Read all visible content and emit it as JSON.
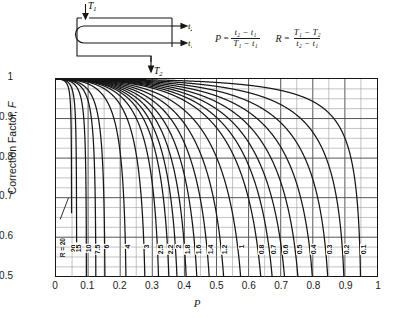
{
  "diagram": {
    "name": "one-shell-two-tube-pass-heat-exchanger",
    "inlet_shell_label": "T₁",
    "outlet_shell_label": "T₂",
    "outlet_tube_label": "t₂",
    "inlet_tube_label": "t₁"
  },
  "formulas": {
    "p": {
      "lhs": "P",
      "numerator": "t₂ − t₁",
      "denominator": "T₁ − t₁"
    },
    "r": {
      "lhs": "R",
      "numerator": "T₁ − T₂",
      "denominator": "t₂ − t₁"
    }
  },
  "chart_data": {
    "type": "line",
    "title": "",
    "xlabel": "P",
    "ylabel": "Correction Factor, F",
    "xlim": [
      0,
      1
    ],
    "ylim": [
      0.5,
      1
    ],
    "xticks": [
      "0",
      "0.1",
      "0.2",
      "0.3",
      "0.4",
      "0.5",
      "0.6",
      "0.7",
      "0.8",
      "0.9",
      "1"
    ],
    "yticks": [
      "0.5",
      "0.6",
      "0.7",
      "0.8",
      "0.9",
      "1"
    ],
    "grid": "major 0.1 x / 0.1 y, minor 0.05 x / 0.025 y",
    "legend": "inline curve labels at F = 0.55",
    "annotation": "R = 20",
    "series_parameter": "R",
    "series": [
      {
        "name": "20",
        "label": "20",
        "values_note": "drops from F=1 near P=0 to F=0.5 at P≈0.047"
      },
      {
        "name": "15",
        "label": "15",
        "values_note": "F=0.5 at P≈0.062"
      },
      {
        "name": "10",
        "label": "10",
        "values_note": "F=0.5 at P≈0.092"
      },
      {
        "name": "7.5",
        "label": "7.5",
        "values_note": "F=0.5 at P≈0.118"
      },
      {
        "name": "6",
        "label": "6",
        "values_note": "F=0.5 at P≈0.143"
      },
      {
        "name": "4",
        "label": "4",
        "values_note": "F=0.5 at P≈0.203"
      },
      {
        "name": "3",
        "label": "3",
        "values_note": "F=0.5 at P≈0.258"
      },
      {
        "name": "2.5",
        "label": "2.5",
        "values_note": "F=0.5 at P≈0.300"
      },
      {
        "name": "2.2",
        "label": "2.2",
        "values_note": "F=0.5 at P≈0.330"
      },
      {
        "name": "2",
        "label": "2",
        "values_note": "F=0.5 at P≈0.356"
      },
      {
        "name": "1.8",
        "label": "1.8",
        "values_note": "F=0.5 at P≈0.386"
      },
      {
        "name": "1.6",
        "label": "1.6",
        "values_note": "F=0.5 at P≈0.420"
      },
      {
        "name": "1.4",
        "label": "1.4",
        "values_note": "F=0.5 at P≈0.462"
      },
      {
        "name": "1.2",
        "label": "1.2",
        "values_note": "F=0.5 at P≈0.512"
      },
      {
        "name": "1",
        "label": "1",
        "values_note": "F=0.5 at P≈0.570"
      },
      {
        "name": "0.8",
        "label": "0.8",
        "values_note": "F=0.5 at P≈0.637"
      },
      {
        "name": "0.7",
        "label": "0.7",
        "values_note": "F=0.5 at P≈0.678"
      },
      {
        "name": "0.6",
        "label": "0.6",
        "values_note": "F=0.5 at P≈0.722"
      },
      {
        "name": "0.5",
        "label": "0.5",
        "values_note": "F=0.5 at P≈0.770"
      },
      {
        "name": "0.4",
        "label": "0.4",
        "values_note": "F=0.5 at P≈0.820"
      },
      {
        "name": "0.3",
        "label": "0.3",
        "values_note": "F=0.5 at P≈0.870"
      },
      {
        "name": "0.2",
        "label": "0.2",
        "values_note": "F=0.5 at P≈0.918"
      },
      {
        "name": "0.1",
        "label": "0.1",
        "values_note": "F=0.5 at P≈0.962"
      }
    ]
  },
  "colors": {
    "ink": "#161616",
    "grid_major": "#555555",
    "grid_minor": "#9a9a9a",
    "background": "#ffffff"
  }
}
